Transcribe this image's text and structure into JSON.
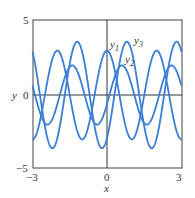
{
  "chart_data": {
    "type": "line",
    "title": "",
    "xlabel": "x",
    "ylabel": "y",
    "xlim": [
      -3,
      3
    ],
    "ylim": [
      -5,
      5
    ],
    "xticks": [
      "-3",
      "0",
      "3"
    ],
    "yticks": [
      "5",
      "0",
      "-5"
    ],
    "series": [
      {
        "name": "y1",
        "formula": "3cos(pi x)",
        "amplitude": 3,
        "period": 2,
        "peak_x": 0
      },
      {
        "name": "y2",
        "formula": "2cos(pi(x-0.6))",
        "amplitude": 2,
        "period": 2,
        "peak_x": 0.6
      },
      {
        "name": "y3",
        "formula": "3.6cos(pi(x-0.8))",
        "amplitude": 3.6,
        "period": 2,
        "peak_x": 0.8
      }
    ],
    "annotations": [
      "y1",
      "y3",
      "y2"
    ],
    "color": "#3a7fd5"
  },
  "labels": {
    "xlabel": "x",
    "ylabel": "y",
    "xmin": "−3",
    "xmid": "0",
    "xmax": "3",
    "ymax": "5",
    "ymid": "0",
    "ymin": "−5",
    "y1": "y",
    "y2": "y",
    "y3": "y",
    "s1": "1",
    "s2": "2",
    "s3": "3"
  }
}
